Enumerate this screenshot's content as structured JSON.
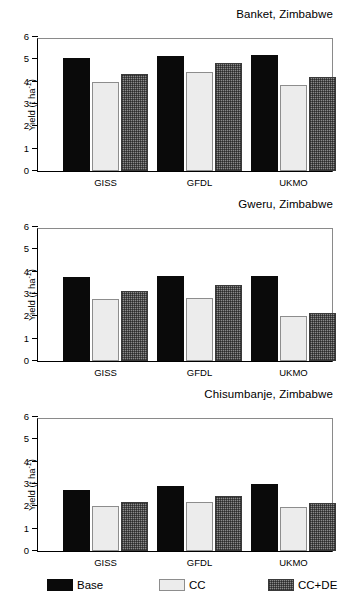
{
  "figure": {
    "ylabel_text": "Yield (t ha",
    "ylabel_sup": "-1",
    "ylabel_tail": ")",
    "yticks": [
      "0",
      "1",
      "2",
      "3",
      "4",
      "5",
      "6"
    ],
    "colors": {
      "base": "#0a0a0a",
      "cc": "#ececec",
      "ccde": "#8a8a8a",
      "axis": "#000000",
      "frame": "#8a8a8a",
      "background": "#ffffff"
    }
  },
  "legend": {
    "items": [
      {
        "label": "Base",
        "swatch": "base-swatch"
      },
      {
        "label": "CC",
        "swatch": "cc-swatch"
      },
      {
        "label": "CC+DE",
        "swatch": "ccde-swatch"
      }
    ]
  },
  "chart_data": [
    {
      "type": "bar",
      "title": "Banket, Zimbabwe",
      "xlabel": "",
      "ylabel": "Yield (t ha-1)",
      "ylim": [
        0,
        6
      ],
      "yticks": [
        0,
        1,
        2,
        3,
        4,
        5,
        6
      ],
      "grid": false,
      "legend_position": "below-figure",
      "categories": [
        "GISS",
        "GFDL",
        "UKMO"
      ],
      "series": [
        {
          "name": "Base",
          "values": [
            5.05,
            5.15,
            5.2
          ]
        },
        {
          "name": "CC",
          "values": [
            4.0,
            4.45,
            3.85
          ]
        },
        {
          "name": "CC+DE",
          "values": [
            4.35,
            4.85,
            4.2
          ]
        }
      ]
    },
    {
      "type": "bar",
      "title": "Gweru, Zimbabwe",
      "xlabel": "",
      "ylabel": "Yield (t ha-1)",
      "ylim": [
        0,
        6
      ],
      "yticks": [
        0,
        1,
        2,
        3,
        4,
        5,
        6
      ],
      "grid": false,
      "legend_position": "below-figure",
      "categories": [
        "GISS",
        "GFDL",
        "UKMO"
      ],
      "series": [
        {
          "name": "Base",
          "values": [
            3.75,
            3.8,
            3.82
          ]
        },
        {
          "name": "CC",
          "values": [
            2.78,
            2.8,
            2.0
          ]
        },
        {
          "name": "CC+DE",
          "values": [
            3.15,
            3.4,
            2.15
          ]
        }
      ]
    },
    {
      "type": "bar",
      "title": "Chisumbanje, Zimbabwe",
      "xlabel": "",
      "ylabel": "Yield (t ha-1)",
      "ylim": [
        0,
        6
      ],
      "yticks": [
        0,
        1,
        2,
        3,
        4,
        5,
        6
      ],
      "grid": false,
      "legend_position": "below-figure",
      "categories": [
        "GISS",
        "GFDL",
        "UKMO"
      ],
      "series": [
        {
          "name": "Base",
          "values": [
            2.75,
            2.9,
            3.0
          ]
        },
        {
          "name": "CC",
          "values": [
            2.0,
            2.2,
            1.95
          ]
        },
        {
          "name": "CC+DE",
          "values": [
            2.18,
            2.48,
            2.15
          ]
        }
      ]
    }
  ]
}
